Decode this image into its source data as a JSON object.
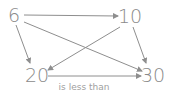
{
  "diagram": {
    "type": "directed-graph",
    "nodes": [
      {
        "id": "n6",
        "label": "6",
        "x": 14,
        "y": 22
      },
      {
        "id": "n10",
        "label": "10",
        "x": 130,
        "y": 23
      },
      {
        "id": "n20",
        "label": "20",
        "x": 37,
        "y": 81
      },
      {
        "id": "n30",
        "label": "30",
        "x": 153,
        "y": 81
      }
    ],
    "edges": [
      {
        "from": "n6",
        "to": "n10",
        "label": ""
      },
      {
        "from": "n6",
        "to": "n20",
        "label": ""
      },
      {
        "from": "n6",
        "to": "n30",
        "label": ""
      },
      {
        "from": "n10",
        "to": "n20",
        "label": ""
      },
      {
        "from": "n10",
        "to": "n30",
        "label": ""
      },
      {
        "from": "n20",
        "to": "n30",
        "label": "is less than"
      }
    ],
    "edge_color": "#8e8e8e",
    "text_color": "#8a8a8a"
  }
}
